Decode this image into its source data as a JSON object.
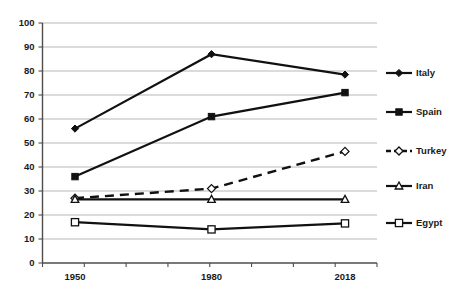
{
  "chart_data": {
    "type": "line",
    "title": "",
    "xlabel": "",
    "ylabel": "",
    "categories": [
      "1950",
      "1980",
      "2018"
    ],
    "ylim": [
      0,
      100
    ],
    "yticks": [
      0,
      10,
      20,
      30,
      40,
      50,
      60,
      70,
      80,
      90,
      100
    ],
    "ytick_labels": [
      "0",
      "10",
      "20",
      "30",
      "40",
      "50",
      "60",
      "70",
      "80",
      "90",
      "100"
    ],
    "grid": true,
    "legend_position": "right",
    "series": [
      {
        "name": "Italy",
        "values": [
          56,
          87,
          78.5
        ],
        "marker": "filled-diamond",
        "line_style": "solid"
      },
      {
        "name": "Spain",
        "values": [
          36,
          61,
          71
        ],
        "marker": "filled-square",
        "line_style": "solid"
      },
      {
        "name": "Turkey",
        "values": [
          27,
          31,
          46.5
        ],
        "marker": "open-diamond",
        "line_style": "dashed"
      },
      {
        "name": "Iran",
        "values": [
          26.5,
          26.5,
          26.5
        ],
        "marker": "open-triangle",
        "line_style": "solid"
      },
      {
        "name": "Egypt",
        "values": [
          17,
          14,
          16.5
        ],
        "marker": "open-square",
        "line_style": "solid"
      }
    ],
    "colors": {
      "line": "#111111",
      "grid": "#9a9a9a",
      "axis": "#4d4d4d",
      "background": "#ffffff",
      "text": "#1a1a1a"
    }
  }
}
